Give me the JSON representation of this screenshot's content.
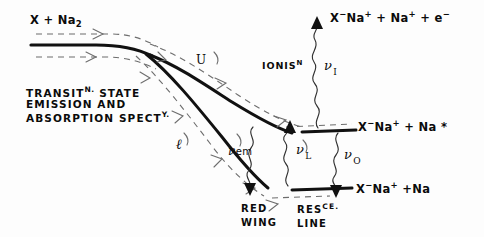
{
  "diagram": {
    "title_entrance": "X + Na",
    "entrance_sub": "2",
    "caption_block": {
      "line1_a": "TRANSIT",
      "line1_sup": "N.",
      "line1_b": " STATE",
      "line2": "EMISSION AND",
      "line3_a": "ABSORPTION SPECT",
      "line3_sup": "Y."
    },
    "branches": {
      "upper": "U",
      "lower": "ℓ"
    },
    "processes": {
      "ionisation_label": "IONIS",
      "ionisation_sup": "N",
      "nu_ionisation": "ν",
      "nu_ionisation_sub": "I",
      "nu_emission": "ν",
      "nu_emission_sub": "em",
      "nu_laser": "ν",
      "nu_laser_sub": "L",
      "nu_output": "ν",
      "nu_output_sub": "O"
    },
    "channels": {
      "top": {
        "x_minus": "X",
        "x_sup": "−",
        "na_plus": "Na",
        "na_sup": "+",
        "plus1": " + ",
        "na2": "Na",
        "na2_sup": "+",
        "plus2": " + ",
        "electron": "e",
        "e_sup": "−"
      },
      "middle": {
        "x_minus": "X",
        "x_sup": "−",
        "na_plus": "Na",
        "na_sup": "+",
        "plus1": " + ",
        "na_excited": "Na",
        "star": " *"
      },
      "bottom": {
        "x_minus": "X",
        "x_sup": "−",
        "na_plus": "Na",
        "na_sup": "+",
        "plus1": " +",
        "na_ground": "Na"
      }
    },
    "bottom_annotations": {
      "red_wing_line1": "RED",
      "red_wing_line2": "WING",
      "fluor_line1_a": "RES",
      "fluor_line1_sup": "CE.",
      "fluor_line2": "LINE"
    },
    "colors": {
      "ink": "#111111",
      "dashed_trajectory": "#6d6d6d",
      "background": "#fdfdfd"
    }
  }
}
